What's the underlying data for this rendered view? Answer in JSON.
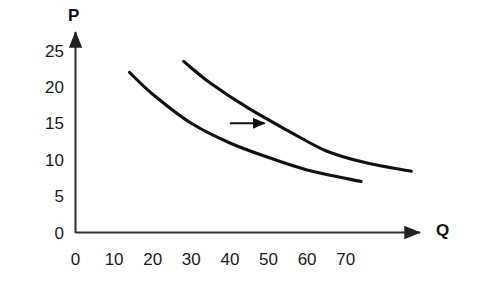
{
  "chart_data": {
    "type": "line",
    "title": "",
    "subtitle": "",
    "xlabel": "Q",
    "ylabel": "P",
    "grid": false,
    "legend": "none",
    "xlim": [
      0,
      90
    ],
    "ylim": [
      0,
      27
    ],
    "x_ticks": [
      "0",
      "10",
      "20",
      "30",
      "40",
      "50",
      "60",
      "70"
    ],
    "x_tick_values": [
      0,
      10,
      20,
      30,
      40,
      50,
      60,
      70
    ],
    "y_ticks": [
      "0",
      "5",
      "10",
      "15",
      "20",
      "25"
    ],
    "y_tick_values": [
      0,
      5,
      10,
      15,
      20,
      25
    ],
    "series": [
      {
        "name": "demand-curve-original",
        "points": [
          [
            14,
            22
          ],
          [
            20,
            19
          ],
          [
            30,
            15
          ],
          [
            40,
            12.3
          ],
          [
            50,
            10.3
          ],
          [
            60,
            8.6
          ],
          [
            74,
            7
          ]
        ]
      },
      {
        "name": "demand-curve-shifted",
        "points": [
          [
            28,
            23.5
          ],
          [
            35,
            20.5
          ],
          [
            45,
            17
          ],
          [
            55,
            14
          ],
          [
            65,
            11.2
          ],
          [
            75,
            9.6
          ],
          [
            87,
            8.4
          ]
        ]
      }
    ],
    "annotations": [
      {
        "name": "shift-arrow",
        "type": "arrow",
        "from": [
          40,
          15
        ],
        "to": [
          49,
          15
        ],
        "label": ""
      }
    ],
    "colors": {
      "curve": "#111111",
      "axis": "#333333",
      "text": "#1a1a1a",
      "background": "#ffffff"
    }
  },
  "axes": {
    "y_axis_title": "P",
    "x_axis_title": "Q"
  }
}
